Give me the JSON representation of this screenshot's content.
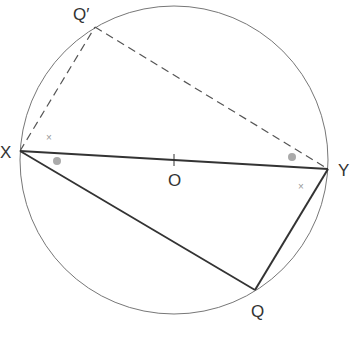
{
  "diagram": {
    "circle": {
      "cx": 174,
      "cy": 160,
      "r": 154,
      "stroke": "#777777"
    },
    "points": {
      "X": {
        "x": 20,
        "y": 151,
        "label": "X"
      },
      "Y": {
        "x": 328,
        "y": 169,
        "label": "Y"
      },
      "O": {
        "x": 174,
        "y": 160,
        "label": "O"
      },
      "Q": {
        "x": 255,
        "y": 290,
        "label": "Q"
      },
      "Qp": {
        "x": 95,
        "y": 27,
        "label": "Q′"
      }
    },
    "labels": {
      "X": "X",
      "Y": "Y",
      "O": "O",
      "Q": "Q",
      "Qp": "Q′"
    },
    "segments": [
      {
        "from": "X",
        "to": "Y",
        "style": "solid",
        "name": "diameter-XY"
      },
      {
        "from": "X",
        "to": "Q",
        "style": "solid",
        "name": "chord-XQ"
      },
      {
        "from": "Y",
        "to": "Q",
        "style": "solid",
        "name": "chord-YQ"
      },
      {
        "from": "X",
        "to": "Qp",
        "style": "dashed",
        "name": "chord-XQprime"
      },
      {
        "from": "Y",
        "to": "Qp",
        "style": "dashed",
        "name": "chord-YQprime"
      }
    ],
    "angle_marks": [
      {
        "type": "dot",
        "x": 57,
        "y": 161,
        "near": "X",
        "color": "#aaaaaa"
      },
      {
        "type": "dot",
        "x": 292,
        "y": 157,
        "near": "Y",
        "color": "#aaaaaa"
      },
      {
        "type": "cross",
        "x": 50,
        "y": 137,
        "near": "X",
        "symbol": "×"
      },
      {
        "type": "cross",
        "x": 302,
        "y": 186,
        "near": "Y",
        "symbol": "×"
      }
    ],
    "colors": {
      "solid_line": "#333333",
      "dashed_line": "#555555",
      "circle": "#777777",
      "mark": "#aaaaaa"
    }
  }
}
